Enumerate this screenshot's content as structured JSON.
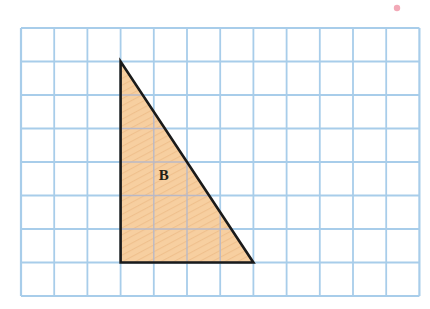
{
  "figure": {
    "background_color": "#ffffff",
    "grid": {
      "name": "square-grid",
      "columns": 12,
      "rows": 8,
      "origin_x": 21,
      "origin_y": 28,
      "cell_width": 33.2,
      "cell_height": 33.5,
      "line_color": "#a8cdea",
      "line_width": 1.8,
      "border_color": "#a8cdea",
      "border_width": 2.2
    },
    "shapes": [
      {
        "name": "triangle-b",
        "kind": "right-triangle",
        "label": "B",
        "label_grid_x": 4.3,
        "label_grid_y": 4.55,
        "fill_color": "#f7cfa0",
        "hatch_color": "#eebf8a",
        "stroke_color": "#1a1a1a",
        "stroke_width": 2.6,
        "vertices_grid": [
          {
            "name": "apex",
            "x": 3,
            "y": 1
          },
          {
            "name": "bottom-left",
            "x": 3,
            "y": 7
          },
          {
            "name": "bottom-right",
            "x": 7,
            "y": 7
          }
        ],
        "vertices_px": [
          {
            "x": 120,
            "y": 61
          },
          {
            "x": 120,
            "y": 263
          },
          {
            "x": 254,
            "y": 263
          }
        ],
        "base_units": 4,
        "height_units": 6
      }
    ],
    "marks": [
      {
        "name": "red-dot-artifact",
        "x": 397,
        "y": 8,
        "radius": 3.2,
        "color": "#e8627c"
      }
    ]
  },
  "chart_data": {
    "type": "diagram",
    "grid": {
      "columns": 12,
      "rows": 8,
      "unit": 1
    },
    "series": [
      {
        "name": "B",
        "points": [
          [
            3,
            1
          ],
          [
            3,
            7
          ],
          [
            7,
            7
          ]
        ],
        "base": 4,
        "height": 6,
        "area": 12
      }
    ],
    "xlabel": "",
    "ylabel": "",
    "xlim": [
      0,
      12
    ],
    "ylim": [
      0,
      8
    ],
    "legend": []
  }
}
